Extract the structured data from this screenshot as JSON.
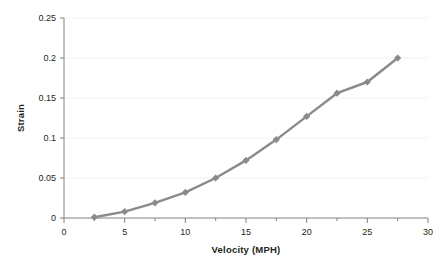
{
  "chart_data": {
    "type": "line",
    "title": "",
    "xlabel": "Velocity (MPH)",
    "ylabel": "Strain",
    "xlim": [
      0,
      30
    ],
    "ylim": [
      0,
      0.25
    ],
    "xticks": [
      "0",
      "5",
      "10",
      "15",
      "20",
      "25",
      "30"
    ],
    "xtick_values": [
      0,
      5,
      10,
      15,
      20,
      25,
      30
    ],
    "yticks": [
      "0",
      "0.05",
      "0.1",
      "0.15",
      "0.2",
      "0.25"
    ],
    "ytick_values": [
      0,
      0.05,
      0.1,
      0.15,
      0.2,
      0.25
    ],
    "grid": "horizontal",
    "legend": "none",
    "marker": "diamond",
    "series_color": "#8a8a8a",
    "grid_color": "#f2f2f2",
    "axis_color": "#808080",
    "x": [
      2.5,
      5,
      7.5,
      10,
      12.5,
      15,
      17.5,
      20,
      22.5,
      25,
      27.5
    ],
    "values": [
      0.001,
      0.008,
      0.019,
      0.032,
      0.05,
      0.072,
      0.098,
      0.127,
      0.156,
      0.17,
      0.2
    ],
    "points": [
      {
        "x": 2.5,
        "y": 0.001
      },
      {
        "x": 5,
        "y": 0.008
      },
      {
        "x": 7.5,
        "y": 0.019
      },
      {
        "x": 10,
        "y": 0.032
      },
      {
        "x": 12.5,
        "y": 0.05
      },
      {
        "x": 15,
        "y": 0.072
      },
      {
        "x": 17.5,
        "y": 0.098
      },
      {
        "x": 20,
        "y": 0.127
      },
      {
        "x": 22.5,
        "y": 0.156
      },
      {
        "x": 25,
        "y": 0.17
      },
      {
        "x": 27.5,
        "y": 0.2
      }
    ]
  }
}
